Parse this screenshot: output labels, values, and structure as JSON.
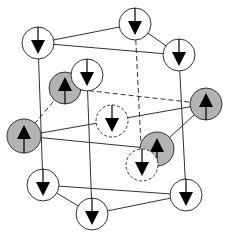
{
  "diagram": {
    "title": "",
    "colors": {
      "line": "#333333",
      "up_fill": "#b3b3b3",
      "down_fill": "#ffffff",
      "arrow": "#000000"
    },
    "edges": [
      {
        "from": [
          38,
          43
        ],
        "to": [
          135,
          24
        ],
        "style": "solid"
      },
      {
        "from": [
          38,
          43
        ],
        "to": [
          179,
          55
        ],
        "style": "solid",
        "via": "top-back"
      },
      {
        "from": [
          135,
          24
        ],
        "to": [
          179,
          55
        ],
        "style": "solid"
      },
      {
        "from": [
          38,
          43
        ],
        "to": [
          43,
          185
        ],
        "style": "solid"
      },
      {
        "from": [
          87,
          75
        ],
        "to": [
          92,
          214
        ],
        "style": "solid"
      },
      {
        "from": [
          179,
          55
        ],
        "to": [
          186,
          195
        ],
        "style": "solid"
      },
      {
        "from": [
          135,
          24
        ],
        "to": [
          142,
          165
        ],
        "style": "dashed"
      },
      {
        "from": [
          43,
          185
        ],
        "to": [
          186,
          195
        ],
        "style": "solid"
      },
      {
        "from": [
          43,
          185
        ],
        "to": [
          92,
          214
        ],
        "style": "solid"
      },
      {
        "from": [
          92,
          214
        ],
        "to": [
          186,
          195
        ],
        "style": "solid"
      },
      {
        "from": [
          24,
          136
        ],
        "to": [
          206,
          104
        ],
        "style": "solid"
      },
      {
        "from": [
          65,
          88
        ],
        "to": [
          206,
          104
        ],
        "style": "dashed"
      },
      {
        "from": [
          24,
          136
        ],
        "to": [
          65,
          88
        ],
        "style": "dashed"
      },
      {
        "from": [
          157,
          149
        ],
        "to": [
          206,
          104
        ],
        "style": "solid"
      },
      {
        "from": [
          24,
          136
        ],
        "to": [
          157,
          149
        ],
        "style": "solid"
      }
    ],
    "atoms": [
      {
        "id": "top-left",
        "x": 38,
        "y": 43,
        "r": 16,
        "spin": "down",
        "style": "solid"
      },
      {
        "id": "top-back",
        "x": 135,
        "y": 24,
        "r": 16,
        "spin": "down",
        "style": "solid"
      },
      {
        "id": "top-right",
        "x": 179,
        "y": 55,
        "r": 16,
        "spin": "down",
        "style": "solid"
      },
      {
        "id": "mid-left-upper",
        "x": 65,
        "y": 88,
        "r": 16,
        "spin": "up",
        "style": "shaded"
      },
      {
        "id": "top-front",
        "x": 87,
        "y": 75,
        "r": 16,
        "spin": "down",
        "style": "solid"
      },
      {
        "id": "mid-left",
        "x": 24,
        "y": 136,
        "r": 17,
        "spin": "up",
        "style": "shaded"
      },
      {
        "id": "center",
        "x": 112,
        "y": 121,
        "r": 16,
        "spin": "down",
        "style": "dashed"
      },
      {
        "id": "mid-right",
        "x": 206,
        "y": 104,
        "r": 16,
        "spin": "up",
        "style": "shaded"
      },
      {
        "id": "mid-center-right",
        "x": 157,
        "y": 149,
        "r": 17,
        "spin": "up",
        "style": "shaded"
      },
      {
        "id": "bottom-back",
        "x": 142,
        "y": 165,
        "r": 16,
        "spin": "down",
        "style": "dashed"
      },
      {
        "id": "bottom-left",
        "x": 43,
        "y": 185,
        "r": 16,
        "spin": "down",
        "style": "solid"
      },
      {
        "id": "bottom-front",
        "x": 92,
        "y": 214,
        "r": 16,
        "spin": "down",
        "style": "solid"
      },
      {
        "id": "bottom-right",
        "x": 186,
        "y": 195,
        "r": 16,
        "spin": "down",
        "style": "solid"
      }
    ]
  }
}
